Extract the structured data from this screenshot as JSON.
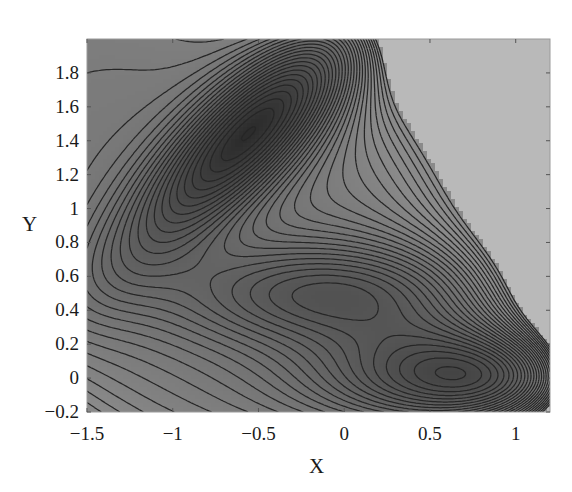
{
  "chart_data": {
    "type": "contour",
    "title": "",
    "xlabel": "X",
    "ylabel": "Y",
    "xlim": [
      -1.5,
      1.2
    ],
    "ylim": [
      -0.2,
      2.0
    ],
    "xticks": [
      -1.5,
      -1,
      -0.5,
      0,
      0.5,
      1
    ],
    "xtick_labels": [
      "−1.5",
      "−1",
      "−0.5",
      "0",
      "0.5",
      "1"
    ],
    "yticks": [
      -0.2,
      0,
      0.2,
      0.4,
      0.6,
      0.8,
      1,
      1.2,
      1.4,
      1.6,
      1.8
    ],
    "ytick_labels": [
      "−0.2",
      "0",
      "0.2",
      "0.4",
      "0.6",
      "0.8",
      "1",
      "1.2",
      "1.4",
      "1.6",
      "1.8"
    ],
    "grid": false,
    "legend": null,
    "minima": [
      {
        "label": "upper-left deep minimum",
        "x": -0.56,
        "y": 1.44
      },
      {
        "label": "central shallow minimum",
        "x": -0.05,
        "y": 0.47
      },
      {
        "label": "lower-right minimum",
        "x": 0.62,
        "y": 0.03
      }
    ],
    "potential": {
      "A": [
        -200,
        -100,
        -170,
        15
      ],
      "a": [
        -1,
        -1,
        -6.5,
        0.7
      ],
      "b": [
        0,
        0,
        11,
        0.6
      ],
      "c": [
        -10,
        -10,
        -6.5,
        0.7
      ],
      "x0": [
        1,
        0,
        -0.5,
        -1
      ],
      "y0": [
        0,
        0.5,
        1.5,
        1
      ]
    },
    "contour_levels": {
      "min": -146,
      "max": 100,
      "step": 8
    },
    "colors": {
      "low": "#2c2c2c",
      "mid": "#8a8a8a",
      "above_max": "#b9b9b9",
      "contour_line": "#262626"
    }
  },
  "plot_box": {
    "left": 87,
    "top": 39,
    "right": 550,
    "bottom": 412
  },
  "panel_mark": "(b)"
}
